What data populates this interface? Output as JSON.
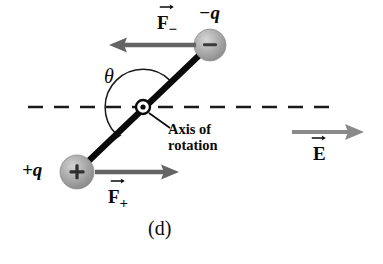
{
  "figure": {
    "panel_label": "(d)",
    "background_color": "#ffffff",
    "ink_color": "#0a0a0a",
    "sphere_fill": "#a9a9a9",
    "arrow_gray": "#6e6e6e",
    "width": 383,
    "height": 264
  },
  "labels": {
    "negative_charge": "−q",
    "positive_charge": "+q",
    "theta": "θ",
    "axis_line1": "Axis of",
    "axis_line2": "rotation",
    "force_minus_letter": "F",
    "force_minus_sub": "−",
    "force_plus_letter": "F",
    "force_plus_sub": "+",
    "field_letter": "E",
    "field_sub": "",
    "sphere_minus_glyph": "−",
    "sphere_plus_glyph": "+"
  },
  "geometry": {
    "dashed_axis_y": 107,
    "dashed_axis_x_start": 28,
    "dashed_axis_x_end": 331,
    "pivot_x": 143,
    "pivot_y": 107,
    "pivot_outer_radius": 7,
    "pivot_dot_radius": 2.6,
    "negative_sphere_cx": 210,
    "negative_sphere_cy": 45,
    "negative_sphere_r": 16,
    "positive_sphere_cx": 77,
    "positive_sphere_cy": 172,
    "positive_sphere_r": 17,
    "theta_arc_radius": 38,
    "force_minus_arrow_from_x": 196,
    "force_minus_arrow_to_x": 110,
    "force_minus_arrow_y": 45,
    "force_plus_arrow_from_x": 95,
    "force_plus_arrow_to_x": 178,
    "force_plus_arrow_y": 172,
    "field_arrow_from_x": 292,
    "field_arrow_to_x": 363,
    "field_arrow_y": 132
  },
  "semantics": {
    "description": "Electric dipole in a uniform field rotating about a pivot",
    "angle_symbol": "theta between dipole axis and field direction",
    "dipole_tilt_degrees": 44
  }
}
